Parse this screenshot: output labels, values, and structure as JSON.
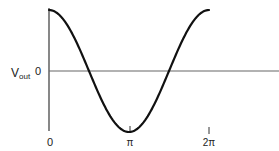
{
  "chart_data": {
    "type": "line",
    "title": "",
    "xlabel": "",
    "ylabel": "V_out",
    "ylabel_main": "V",
    "ylabel_sub": "out",
    "y_zero_label": "0",
    "x_ticks": [
      {
        "value": 0,
        "label": "0"
      },
      {
        "value": 3.14159,
        "label": "π"
      },
      {
        "value": 6.28318,
        "label": "2π"
      }
    ],
    "series": [
      {
        "name": "V_out",
        "function": "cos(x)",
        "x_range": [
          0,
          6.28318
        ],
        "amplitude": 1
      }
    ],
    "xlim": [
      0,
      7.5
    ],
    "ylim": [
      -1,
      1
    ],
    "grid": false,
    "legend": "none"
  },
  "style": {
    "curve_color": "#111111",
    "axis_color": "#555555",
    "text_color": "#222222"
  }
}
